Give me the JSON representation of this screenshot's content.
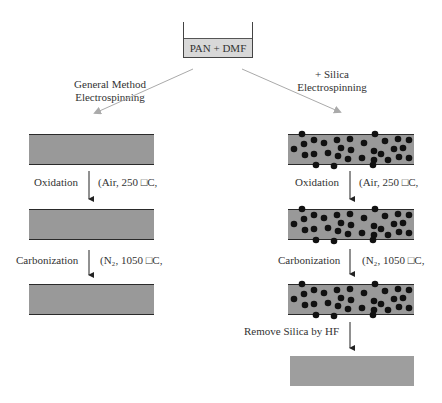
{
  "source": {
    "label": "PAN + DMF"
  },
  "branches": {
    "left": {
      "method_line1": "General Method",
      "method_line2": "Electrospinning",
      "steps": [
        {
          "label": "Oxidation",
          "condition": "(Air, 250 □C,"
        },
        {
          "label": "Carbonization",
          "condition": "(N₂, 1050 □C,"
        }
      ]
    },
    "right": {
      "method_line1": "+ Silica",
      "method_line2": "Electrospinning",
      "steps": [
        {
          "label": "Oxidation",
          "condition": "(Air, 250 □C,"
        },
        {
          "label": "Carbonization",
          "condition": "(N₂, 1050 □C,"
        },
        {
          "label": "Remove Silica by HF",
          "condition": ""
        }
      ]
    }
  },
  "colors": {
    "fiber_fill": "#999999",
    "fiber_edge": "#2a2a2a",
    "silica_dot": "#111111",
    "arrow_gray": "#aaaaaa",
    "beaker_liquid": "#d8d8d8"
  }
}
